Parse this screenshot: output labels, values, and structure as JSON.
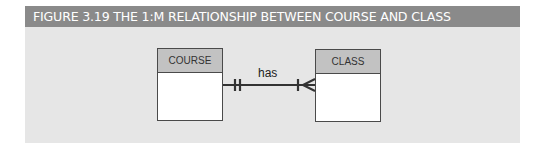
{
  "figure": {
    "title": "FIGURE 3.19  THE 1:M RELATIONSHIP BETWEEN COURSE AND CLASS"
  },
  "entities": [
    {
      "name": "COURSE"
    },
    {
      "name": "CLASS"
    }
  ],
  "relationship": {
    "label": "has",
    "type": "1:M",
    "left_end": "mandatory-one",
    "right_end": "mandatory-many"
  },
  "colors": {
    "title_bar": "#8a8a8a",
    "panel": "#e6e6e6",
    "entity_header": "#c2c2c2",
    "line": "#333333"
  }
}
